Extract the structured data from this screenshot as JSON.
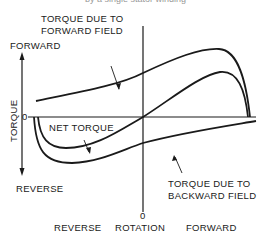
{
  "caption": "by a single stator winding",
  "labels": {
    "forward_field": [
      "TORQUE DUE TO",
      "FORWARD FIELD"
    ],
    "backward_field": [
      "TORQUE DUE TO",
      "BACKWARD FIELD"
    ],
    "net_torque": "NET TORQUE",
    "torque_axis": "TORQUE",
    "torque_forward": "FORWARD",
    "torque_reverse": "REVERSE",
    "torque_zero": "0",
    "rotation_zero": "0",
    "rotation_reverse": "REVERSE",
    "rotation": "ROTATION",
    "rotation_forward": "FORWARD"
  },
  "colors": {
    "line": "#1a1a1a",
    "background": "#ffffff"
  }
}
